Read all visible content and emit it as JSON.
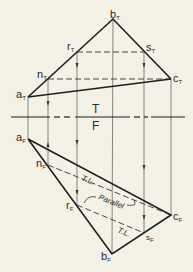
{
  "diagram": {
    "type": "descriptive-geometry-projection",
    "background": "#f4f1e6",
    "line_color": "#222222",
    "fold_line": {
      "label_top": "T",
      "label_bottom": "F",
      "y": 117
    },
    "top_view": {
      "points": [
        {
          "name": "a",
          "sub": "T",
          "x": 28,
          "y": 97
        },
        {
          "name": "b",
          "sub": "T",
          "x": 113,
          "y": 19
        },
        {
          "name": "c",
          "sub": "T",
          "x": 171,
          "y": 79
        },
        {
          "name": "n",
          "sub": "T",
          "x": 48,
          "y": 79
        },
        {
          "name": "r",
          "sub": "T",
          "x": 77,
          "y": 52
        },
        {
          "name": "s",
          "sub": "T",
          "x": 144,
          "y": 52
        }
      ]
    },
    "front_view": {
      "points": [
        {
          "name": "a",
          "sub": "F",
          "x": 28,
          "y": 139
        },
        {
          "name": "b",
          "sub": "F",
          "x": 112,
          "y": 254
        },
        {
          "name": "c",
          "sub": "F",
          "x": 171,
          "y": 215
        },
        {
          "name": "n",
          "sub": "F",
          "x": 48,
          "y": 165
        },
        {
          "name": "r",
          "sub": "F",
          "x": 77,
          "y": 205
        },
        {
          "name": "s",
          "sub": "F",
          "x": 144,
          "y": 233
        }
      ]
    },
    "annotations": {
      "true_length_1": "T.L.",
      "true_length_2": "T.L.",
      "parallel": "Parallel"
    }
  }
}
